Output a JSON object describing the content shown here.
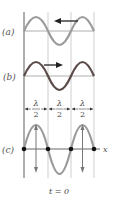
{
  "diagram": {
    "panels": [
      {
        "id": "a",
        "label": "(a)",
        "direction": "left",
        "wave_color": "#9a9a9a"
      },
      {
        "id": "b",
        "label": "(b)",
        "direction": "right",
        "wave_color": "#5a4a48"
      },
      {
        "id": "c",
        "label": "(c)",
        "axis_label": "x",
        "wave_color": "#9a9a9a"
      }
    ],
    "spacing_labels": [
      {
        "numerator": "λ",
        "denominator": "2"
      },
      {
        "numerator": "λ",
        "denominator": "2"
      },
      {
        "numerator": "λ",
        "denominator": "2"
      }
    ],
    "time_label": "t = 0",
    "colors": {
      "grid_line": "#cfcfcf",
      "axis": "#8a8a8a",
      "node_dot": "#111111",
      "arrow": "#222222"
    }
  }
}
